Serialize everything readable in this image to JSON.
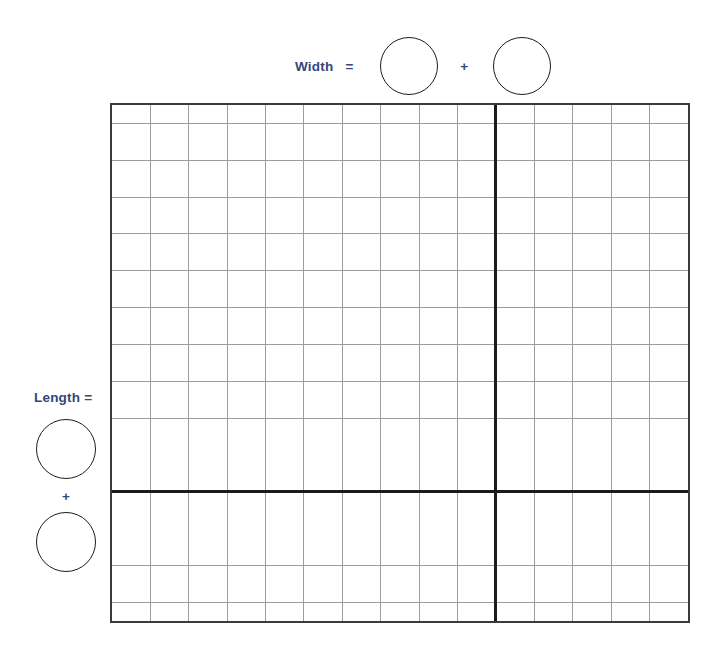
{
  "worksheet": {
    "type": "area-model-grid",
    "background_color": "#ffffff",
    "label_color": "#33477a",
    "grid_line_color": "#9d9d9d",
    "grid_border_color": "#3b3b3b",
    "divider_color": "#1e1a18",
    "circle_border_color": "#1b1b1b"
  },
  "width_label": {
    "text": "Width",
    "equals": "=",
    "plus": "+",
    "blank_1": "",
    "blank_2": ""
  },
  "length_label": {
    "text": "Length =",
    "plus": "+",
    "blank_1": "",
    "blank_2": ""
  },
  "grid": {
    "columns": 15,
    "rows": 13,
    "vertical_divider_after_column": 10,
    "horizontal_divider_after_row": 10,
    "cell_width_px": 38.7,
    "cell_height_px": 40,
    "cells": []
  }
}
